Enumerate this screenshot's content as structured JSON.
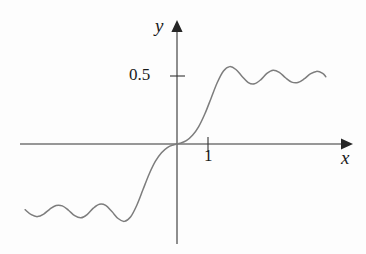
{
  "figure": {
    "background_color": "#fdfdfd",
    "curve_color": "#7d7d7d",
    "axis_color": "#333333",
    "text_color": "#1a1a1a"
  },
  "axes": {
    "x_label": "x",
    "y_label": "y",
    "x_arrow": "arrow-right",
    "y_arrow": "arrow-up",
    "origin_px": [
      177,
      144
    ],
    "x_unit_px": 31,
    "y_unit_px": 136
  },
  "ticks": {
    "y": [
      {
        "label": "0.5",
        "value": 0.5
      }
    ],
    "x": [
      {
        "label": "1",
        "value": 1
      }
    ]
  },
  "chart_data": {
    "type": "line",
    "title": "",
    "subtitle": "",
    "xlabel": "x",
    "ylabel": "y",
    "grid": false,
    "legend": "none",
    "xlim": [
      -4.9,
      4.8
    ],
    "ylim": [
      -0.66,
      0.72
    ],
    "x_ticks": [
      1
    ],
    "x_tick_labels": [
      "1"
    ],
    "y_ticks": [
      0.5
    ],
    "y_tick_labels": [
      "0.5"
    ],
    "annotations": [],
    "series": [
      {
        "name": "f(x)",
        "asymptote_positive": 0.5,
        "asymptote_negative": -0.5,
        "x": [
          -4.9,
          -4.7,
          -4.5,
          -4.3,
          -4.1,
          -3.9,
          -3.7,
          -3.5,
          -3.3,
          -3.1,
          -2.9,
          -2.7,
          -2.5,
          -2.3,
          -2.1,
          -1.9,
          -1.7,
          -1.5,
          -1.3,
          -1.1,
          -0.9,
          -0.7,
          -0.5,
          -0.3,
          -0.1,
          0.0,
          0.1,
          0.3,
          0.5,
          0.7,
          0.9,
          1.1,
          1.3,
          1.5,
          1.7,
          1.9,
          2.1,
          2.3,
          2.5,
          2.7,
          2.9,
          3.1,
          3.3,
          3.5,
          3.7,
          3.9,
          4.1,
          4.3,
          4.5,
          4.7,
          4.8
        ],
        "values": [
          -0.483,
          -0.52,
          -0.534,
          -0.515,
          -0.478,
          -0.452,
          -0.455,
          -0.487,
          -0.527,
          -0.543,
          -0.519,
          -0.472,
          -0.443,
          -0.452,
          -0.497,
          -0.548,
          -0.569,
          -0.537,
          -0.452,
          -0.337,
          -0.222,
          -0.128,
          -0.064,
          -0.024,
          -0.005,
          0.0,
          0.005,
          0.024,
          0.064,
          0.128,
          0.222,
          0.337,
          0.452,
          0.537,
          0.569,
          0.548,
          0.497,
          0.452,
          0.443,
          0.472,
          0.519,
          0.543,
          0.527,
          0.487,
          0.455,
          0.452,
          0.478,
          0.515,
          0.534,
          0.52,
          0.495
        ]
      }
    ]
  }
}
